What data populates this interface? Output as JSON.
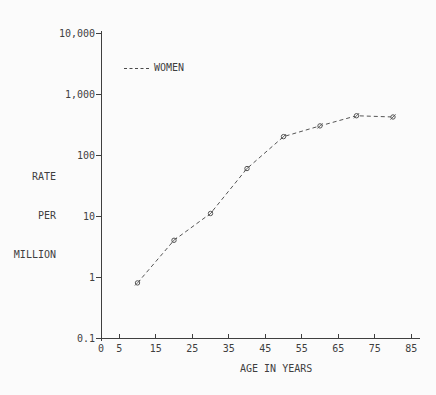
{
  "chart_data": {
    "type": "line",
    "title": "",
    "xlabel": "AGE IN YEARS",
    "ylabel": "RATE PER MILLION",
    "ylabel_lines": [
      "RATE",
      "PER",
      "MILLION"
    ],
    "x_ticks": [
      0,
      5,
      15,
      25,
      35,
      45,
      55,
      65,
      75,
      85
    ],
    "y_ticks": [
      0.1,
      1,
      10,
      100,
      1000,
      10000
    ],
    "y_tick_labels": [
      "0.1",
      "1",
      "10",
      "100",
      "1,000",
      "10,000"
    ],
    "y_scale": "log",
    "xlim": [
      0,
      87
    ],
    "ylim": [
      0.1,
      10000
    ],
    "grid": false,
    "legend_position": "upper-left-inside",
    "series": [
      {
        "name": "WOMEN",
        "line_style": "dashed",
        "marker": "slashed-circle",
        "x": [
          10,
          20,
          30,
          40,
          50,
          60,
          70,
          80
        ],
        "values": [
          0.8,
          4,
          11,
          60,
          200,
          300,
          440,
          420
        ]
      }
    ],
    "colors": {
      "ink": "#3f3f3f",
      "curve": "#555555",
      "background": "#fbfbfb"
    }
  }
}
